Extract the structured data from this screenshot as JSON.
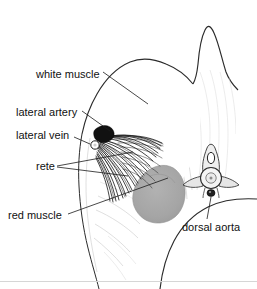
{
  "figure": {
    "background_color": "#ffffff",
    "line_color": "#2b2b2b",
    "label_color": "#111111",
    "labels": [
      {
        "id": "white-muscle",
        "text": "white muscle",
        "x": 36,
        "y": 75,
        "anchor": "start"
      },
      {
        "id": "lateral-artery",
        "text": "lateral artery",
        "x": 16,
        "y": 113,
        "anchor": "start"
      },
      {
        "id": "lateral-vein",
        "text": "lateral vein",
        "x": 16,
        "y": 136,
        "anchor": "start"
      },
      {
        "id": "rete",
        "text": "rete",
        "x": 36,
        "y": 167,
        "anchor": "start"
      },
      {
        "id": "red-muscle",
        "text": "red muscle",
        "x": 8,
        "y": 216,
        "anchor": "start"
      },
      {
        "id": "dorsal-aorta",
        "text": "dorsal aorta",
        "x": 182,
        "y": 228,
        "anchor": "start"
      }
    ],
    "structures": [
      {
        "id": "white-muscle-region",
        "name": "white muscle",
        "fill": "#ffffff",
        "note": "large pale dorsal muscle mass with faint myoseptal lines"
      },
      {
        "id": "red-muscle-region",
        "name": "red muscle",
        "fill": "#a8a8a8",
        "note": "medium-gray rounded mass near midline"
      },
      {
        "id": "rete-region",
        "name": "rete mirabile",
        "fill": "#111111",
        "note": "dense dark fan of converging vessel bundles"
      },
      {
        "id": "lateral-artery-blob",
        "name": "lateral artery",
        "fill": "#111111",
        "note": "solid dark blob at cutaneous margin"
      },
      {
        "id": "lateral-vein-circle",
        "name": "lateral vein",
        "fill": "#ffffff",
        "note": "small open circle below lateral artery"
      },
      {
        "id": "vertebra",
        "name": "vertebral centrum",
        "fill": "#f2f2f2",
        "note": "circular centrum with lateral wing processes and neural arch"
      },
      {
        "id": "dorsal-aorta-vessel",
        "name": "dorsal aorta",
        "fill": "#222222",
        "note": "small dark vessel ventral to centrum"
      },
      {
        "id": "dorsal-fin-ridge",
        "name": "dorsal fin ridge",
        "fill": "none",
        "note": "tall narrow peak at top of body outline"
      }
    ]
  }
}
